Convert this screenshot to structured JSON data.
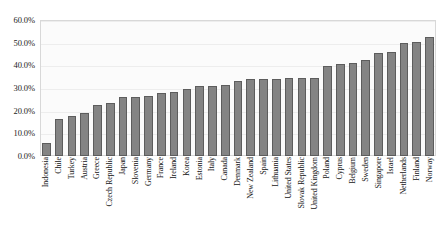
{
  "chart_data": {
    "type": "bar",
    "title": "",
    "xlabel": "",
    "ylabel": "",
    "ylim": [
      0,
      60
    ],
    "ytick_labels": [
      "60.0%",
      "50.0%",
      "40.0%",
      "30.0%",
      "20.0%",
      "10.0%",
      "0.0%"
    ],
    "ytick_values": [
      60,
      50,
      40,
      30,
      20,
      10,
      0
    ],
    "grid": true,
    "legend": "none",
    "bar_color": "#848484",
    "bar_edge_color": "#5d5d5d",
    "plot_background": "#fbfbfb",
    "categories": [
      "Indonesia",
      "Chile",
      "Turkey",
      "Austria",
      "Greece",
      "Czech Republic",
      "Japan",
      "Slovenia",
      "Germany",
      "France",
      "Ireland",
      "Korea",
      "Estonia",
      "Italy",
      "Canada",
      "Denmark",
      "New Zealand",
      "Spain",
      "Lithuania",
      "United States",
      "Slovak Republic",
      "United Kingdom",
      "Poland",
      "Cyprus",
      "Belgium",
      "Sweden",
      "Singapore",
      "Israel",
      "Netherlands",
      "Finland",
      "Norway"
    ],
    "values": [
      5.8,
      16.5,
      17.8,
      19.0,
      22.6,
      23.3,
      26.0,
      26.0,
      26.3,
      27.7,
      28.2,
      29.5,
      30.7,
      30.8,
      31.5,
      33.2,
      34.0,
      34.0,
      34.0,
      34.2,
      34.2,
      34.5,
      39.8,
      40.5,
      41.0,
      42.5,
      45.5,
      46.0,
      50.0,
      50.5,
      52.5
    ]
  }
}
